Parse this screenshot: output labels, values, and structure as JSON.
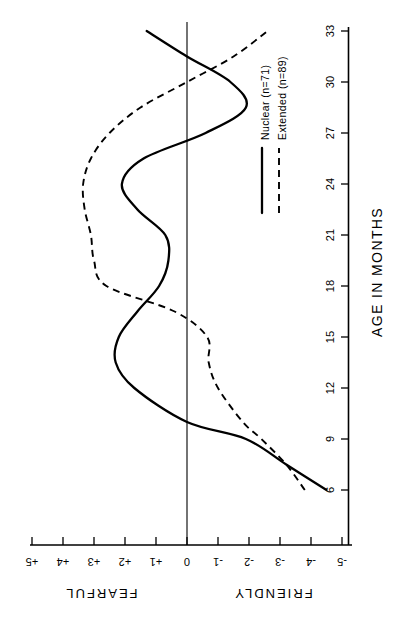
{
  "figure": {
    "orientation": "rotated-90-ccw",
    "background_color": "#ffffff",
    "ink_color": "#000000"
  },
  "axes": {
    "value_axis": {
      "title_positive": "FEARFUL",
      "title_negative": "FRIENDLY",
      "tick_labels": [
        "+5",
        "+4",
        "+3",
        "+2",
        "+1",
        "0",
        "-1",
        "-2",
        "-3",
        "-4",
        "-5"
      ],
      "range": [
        5,
        -5
      ]
    },
    "age_axis": {
      "title": "AGE IN MONTHS",
      "tick_labels": [
        "6",
        "9",
        "12",
        "15",
        "18",
        "21",
        "24",
        "27",
        "30",
        "33"
      ],
      "range": [
        4.5,
        34
      ]
    }
  },
  "legend": {
    "entries": [
      {
        "label": "Nuclear  (n=71)",
        "style": "solid"
      },
      {
        "label": "Extended (n=89)",
        "style": "dashed"
      }
    ]
  },
  "chart_data": {
    "type": "line",
    "title": "",
    "xlabel": "AGE IN MONTHS",
    "ylabel": "FEARFUL / FRIENDLY",
    "xlim": [
      4.5,
      34
    ],
    "ylim": [
      -5,
      5
    ],
    "grid": false,
    "legend_position": "center-right",
    "annotations": [
      "FEARFUL",
      "FRIENDLY"
    ],
    "x": [
      6,
      7.5,
      9,
      10,
      12,
      13.5,
      15,
      16.5,
      18,
      19.5,
      21,
      22.5,
      24,
      25.5,
      27,
      28.5,
      30,
      31.5,
      33
    ],
    "series": [
      {
        "name": "Nuclear  (n=71)",
        "style": "solid",
        "values": [
          -4.5,
          -3.2,
          -1.9,
          0.0,
          1.7,
          2.3,
          2.2,
          1.6,
          0.9,
          0.6,
          0.7,
          1.6,
          2.1,
          1.4,
          -0.6,
          -1.9,
          -1.4,
          0.0,
          1.3
        ]
      },
      {
        "name": "Extended (n=89)",
        "style": "dashed",
        "values": [
          -3.8,
          -3.2,
          -2.4,
          -1.8,
          -1.0,
          -0.7,
          -0.65,
          0.4,
          2.6,
          3.0,
          3.1,
          3.3,
          3.35,
          3.1,
          2.5,
          1.5,
          0.0,
          -1.5,
          -2.6
        ]
      }
    ]
  }
}
